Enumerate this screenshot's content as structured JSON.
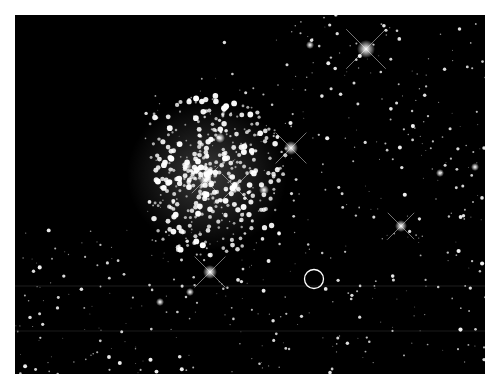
{
  "image": {
    "subject": "globular star cluster field (astronomical photograph)",
    "background_color": "#000000",
    "star_color": "#ffffff",
    "annotation": {
      "type": "circle-marker",
      "color": "#ffffff",
      "label": ""
    }
  }
}
